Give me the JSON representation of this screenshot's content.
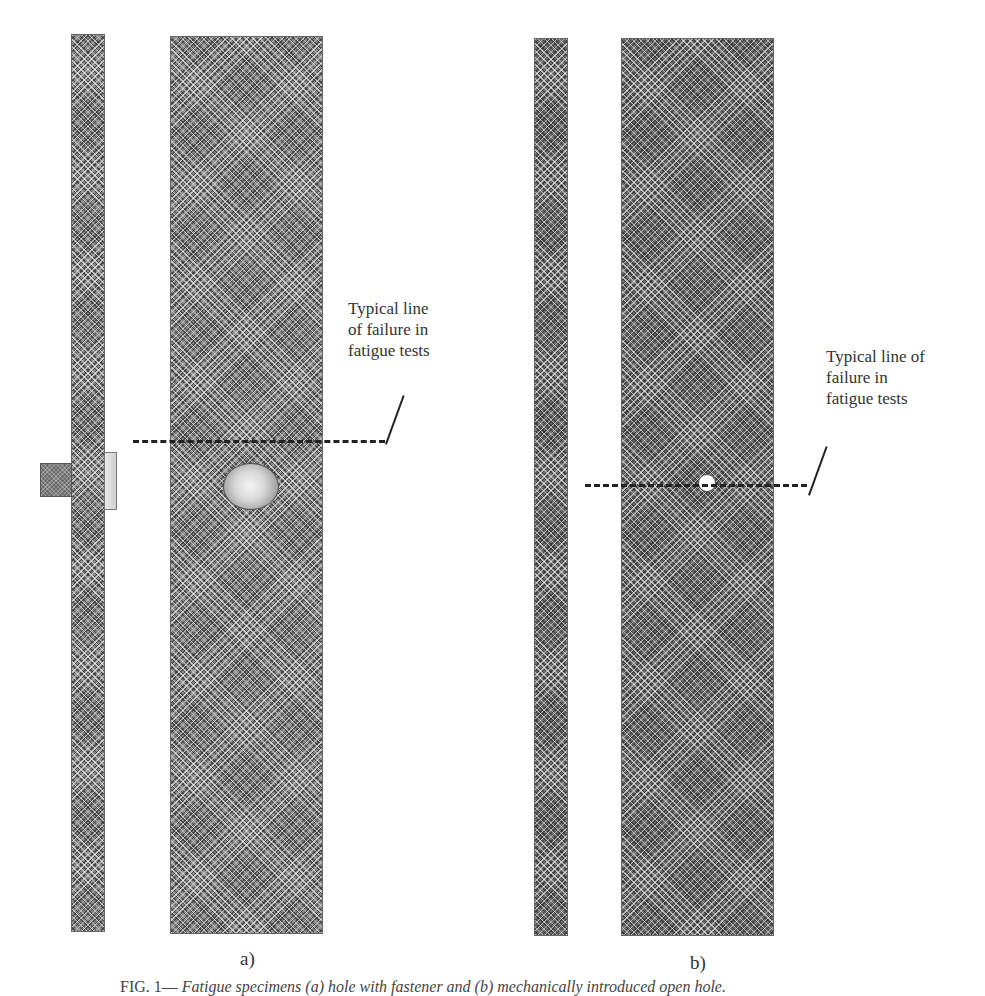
{
  "figure": {
    "panel_a": {
      "label": "a)",
      "annotation": "Typical line\nof failure in\nfatigue tests"
    },
    "panel_b": {
      "label": "b)",
      "annotation": "Typical line of\nfailure in\nfatigue tests"
    },
    "caption": {
      "prefix": "FIG. 1—",
      "text": "Fatigue specimens (a) hole with fastener and (b) mechanically introduced open hole."
    }
  },
  "colors": {
    "specimen_fill": "#8a8a8a",
    "line": "#222222",
    "text": "#333333"
  }
}
